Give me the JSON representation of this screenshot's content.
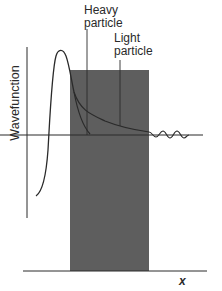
{
  "figure": {
    "y_axis_label": "Wavefunction",
    "x_axis_label": "x",
    "labels": {
      "heavy": {
        "line1": "Heavy",
        "line2": "particle"
      },
      "light": {
        "line1": "Light",
        "line2": "particle"
      }
    },
    "colors": {
      "barrier": "#5e5e5e",
      "line": "#2a2a2a",
      "background": "#ffffff"
    }
  }
}
